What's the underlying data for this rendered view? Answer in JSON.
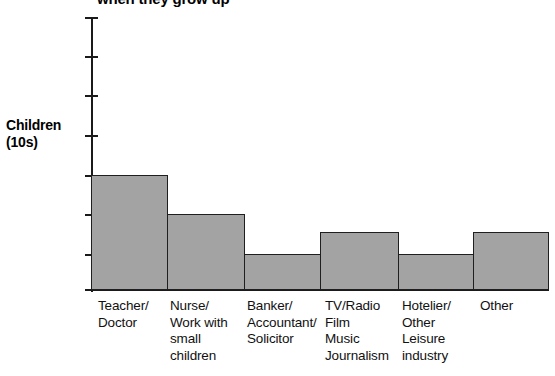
{
  "chart_data": {
    "type": "bar",
    "title": "when they grow up",
    "xlabel": "",
    "ylabel": "Children (10s)",
    "ylabel_lines": [
      "Children",
      "(10s)"
    ],
    "categories": [
      "Teacher/ Doctor",
      "Nurse/ Work with small children",
      "Banker/ Accountant/ Solicitor",
      "TV/Radio Film Music Journalism",
      "Hotelier/ Other Leisure industry",
      "Other"
    ],
    "category_lines": [
      [
        "Teacher/",
        "Doctor"
      ],
      [
        "Nurse/",
        "Work with",
        "small",
        "children"
      ],
      [
        "Banker/",
        "Accountant/",
        "Solicitor"
      ],
      [
        "TV/Radio",
        "Film",
        "Music",
        "Journalism"
      ],
      [
        "Hotelier/",
        "Other",
        "Leisure",
        "industry"
      ],
      [
        "Other"
      ]
    ],
    "values": [
      3,
      2,
      1,
      1.5,
      1,
      1.5
    ],
    "ylim": [
      0,
      7
    ],
    "yticks": [
      0,
      1,
      2,
      3,
      4,
      5,
      6,
      7
    ],
    "ytick_labels": [
      "",
      "",
      "",
      "",
      "",
      "",
      "",
      ""
    ],
    "grid": false,
    "legend": "none",
    "bar_color": "#a3a3a3",
    "bar_border_color": "#1f1f1f",
    "axis_color": "#1a1a1a"
  },
  "bars": [
    {
      "label": "Teacher/ Doctor",
      "left": 91,
      "width": 77,
      "top": 175,
      "height": 115
    },
    {
      "label": "Nurse/ Work with small children",
      "left": 167,
      "width": 78,
      "top": 214,
      "height": 76
    },
    {
      "label": "Banker/ Accountant/ Solicitor",
      "left": 244,
      "width": 77,
      "top": 254,
      "height": 36
    },
    {
      "label": "TV/Radio Film Music Journalism",
      "left": 320,
      "width": 79,
      "top": 232,
      "height": 58
    },
    {
      "label": "Hotelier/ Other Leisure industry",
      "left": 398,
      "width": 76,
      "top": 254,
      "height": 36
    },
    {
      "label": "Other",
      "left": 473,
      "width": 76,
      "top": 232,
      "height": 58
    }
  ],
  "ticks": [
    17,
    56,
    95,
    135,
    175,
    214,
    254,
    289
  ],
  "label_positions": [
    98,
    170,
    247,
    325,
    402,
    480
  ]
}
